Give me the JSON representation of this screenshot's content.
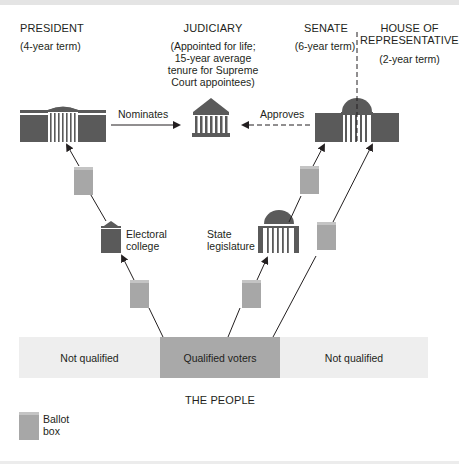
{
  "header": {
    "president": {
      "title": "PRESIDENT",
      "term": "(4-year term)"
    },
    "judiciary": {
      "title": "JUDICIARY",
      "term_lines": [
        "(Appointed for life;",
        "15-year average",
        "tenure for Supreme",
        "Court appointees)"
      ]
    },
    "senate": {
      "title": "SENATE",
      "term": "(6-year term)"
    },
    "house": {
      "title_lines": [
        "HOUSE OF",
        "REPRESENTATIVES"
      ],
      "term": "(2-year term)"
    }
  },
  "arrows": {
    "nominates": "Nominates",
    "approves": "Approves"
  },
  "intermediaries": {
    "electoral_college": [
      "Electoral",
      "college"
    ],
    "state_legislature": [
      "State",
      "legislature"
    ]
  },
  "people": {
    "segments": [
      {
        "label": "Not qualified"
      },
      {
        "label": "Qualified voters"
      },
      {
        "label": "Not qualified"
      }
    ],
    "caption": "THE PEOPLE"
  },
  "legend": {
    "ballot_box": [
      "Ballot",
      "box"
    ]
  },
  "colors": {
    "building_dark": "#5a5a5a",
    "ballot_box": "#a7a7a7",
    "ballot_box_top": "#c4c4c4",
    "qualified_band": "#a9a9a9",
    "unqualified_band": "#eeeeee",
    "line": "#231f20"
  }
}
